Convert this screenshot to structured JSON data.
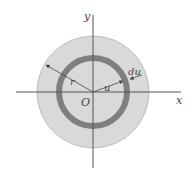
{
  "diagram": {
    "type": "annulus-disk",
    "labels": {
      "y_axis": "y",
      "x_axis": "x",
      "origin": "O",
      "outer_radius": "r",
      "inner_radius": "u",
      "ring_width": "du"
    },
    "colors": {
      "disk_fill": "#d9d9d9",
      "disk_stroke": "#b8b8b8",
      "ring": "#7f7f7f",
      "axes": "#555555",
      "text": "#444444",
      "background": "#ffffff"
    },
    "geometry": {
      "center": [
        93,
        92
      ],
      "disk_radius": 56,
      "ring_radius": 34,
      "ring_thickness": 6
    }
  }
}
